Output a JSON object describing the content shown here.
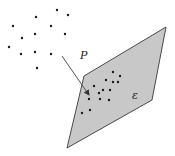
{
  "diagram": {
    "labels": {
      "point_set": "P",
      "plane": "ε"
    },
    "colors": {
      "plane_fill": "#c8c8c8",
      "plane_stroke": "#4a4a4a",
      "dot": "#1a1a1a",
      "arrow": "#555555"
    }
  }
}
